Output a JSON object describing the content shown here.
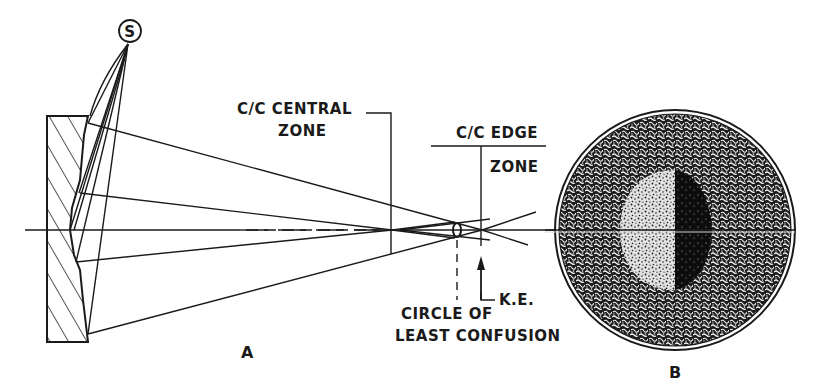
{
  "figure": {
    "panel_a_label": "A",
    "panel_b_label": "B",
    "source_label": "S",
    "labels": {
      "central_zone_line1": "C/C CENTRAL",
      "central_zone_line2": "ZONE",
      "edge_zone_line1": "C/C EDGE",
      "edge_zone_line2": "ZONE",
      "knife_edge": "K.E.",
      "circle_line1": "CIRCLE OF",
      "circle_line2": "LEAST CONFUSION"
    },
    "colors": {
      "ink": "#1a1a1a",
      "background": "#ffffff"
    }
  }
}
